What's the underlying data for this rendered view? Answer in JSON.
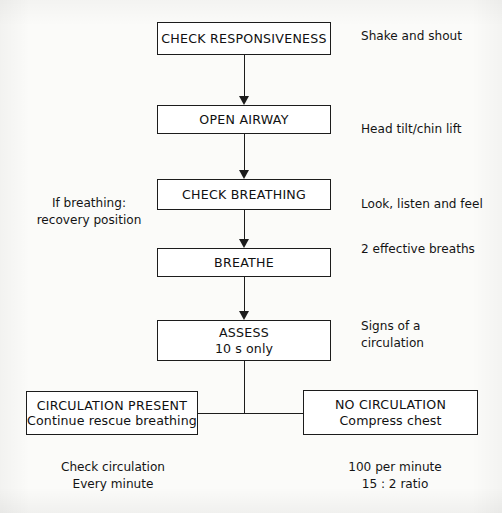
{
  "diagram": {
    "type": "flowchart",
    "colors": {
      "background": "#fbfbf9",
      "box_fill": "#ffffff",
      "stroke": "#1c1c1c",
      "text": "#141414"
    },
    "nodes": [
      {
        "id": "check-responsiveness",
        "line1": "CHECK RESPONSIVENESS",
        "line2": ""
      },
      {
        "id": "open-airway",
        "line1": "OPEN AIRWAY",
        "line2": ""
      },
      {
        "id": "check-breathing",
        "line1": "CHECK BREATHING",
        "line2": ""
      },
      {
        "id": "breathe",
        "line1": "BREATHE",
        "line2": ""
      },
      {
        "id": "assess",
        "line1": "ASSESS",
        "line2": "10 s only"
      },
      {
        "id": "circulation-present",
        "line1": "CIRCULATION PRESENT",
        "line2": "Continue rescue breathing"
      },
      {
        "id": "no-circulation",
        "line1": "NO CIRCULATION",
        "line2": "Compress chest"
      }
    ],
    "annotations": {
      "left_breathing": {
        "line1": "If breathing:",
        "line2": "recovery position"
      },
      "right_responsiveness": {
        "line1": "Shake and shout",
        "line2": ""
      },
      "right_airway": {
        "line1": "Head tilt/chin lift",
        "line2": ""
      },
      "right_breathing": {
        "line1": "Look, listen and feel",
        "line2": ""
      },
      "right_breathe": {
        "line1": "2 effective breaths",
        "line2": ""
      },
      "right_assess": {
        "line1": "Signs of a",
        "line2": "circulation"
      },
      "footer_left": {
        "line1": "Check circulation",
        "line2": "Every minute"
      },
      "footer_right": {
        "line1": "100 per minute",
        "line2": "15 : 2 ratio"
      }
    }
  }
}
